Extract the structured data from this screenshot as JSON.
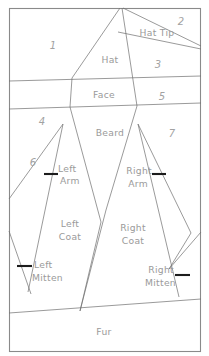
{
  "diagram": {
    "colors": {
      "line": "#6f6f6f",
      "frame": "#8a8a8a",
      "tick": "#1c1c1c",
      "text": "#9a9a9a",
      "background": "#ffffff"
    },
    "named_regions": [
      {
        "id": "hat",
        "label": "Hat",
        "x": 110,
        "y": 60
      },
      {
        "id": "hat-tip",
        "label": "Hat Tip",
        "x": 157,
        "y": 33
      },
      {
        "id": "face",
        "label": "Face",
        "x": 104,
        "y": 95
      },
      {
        "id": "beard",
        "label": "Beard",
        "x": 110,
        "y": 133
      },
      {
        "id": "left-arm",
        "label": "Left",
        "x": 65,
        "y": 169
      },
      {
        "id": "left-arm-2",
        "label": "Arm",
        "x": 65,
        "y": 181
      },
      {
        "id": "right-arm",
        "label": "Right",
        "x": 141,
        "y": 171
      },
      {
        "id": "right-arm-2",
        "label": "Arm",
        "x": 141,
        "y": 184
      },
      {
        "id": "left-coat",
        "label": "Left",
        "x": 70,
        "y": 224
      },
      {
        "id": "left-coat-2",
        "label": "Coat",
        "x": 70,
        "y": 237
      },
      {
        "id": "right-coat",
        "label": "Right",
        "x": 132,
        "y": 228
      },
      {
        "id": "right-coat-2",
        "label": "Coat",
        "x": 132,
        "y": 241
      },
      {
        "id": "left-mitten",
        "label": "Left",
        "x": 43,
        "y": 265
      },
      {
        "id": "left-mitten-2",
        "label": "Mitten",
        "x": 47,
        "y": 278
      },
      {
        "id": "right-mitten",
        "label": "Right",
        "x": 160,
        "y": 270
      },
      {
        "id": "right-mitten-2",
        "label": "Mitten",
        "x": 162,
        "y": 283
      },
      {
        "id": "fur",
        "label": "Fur",
        "x": 104,
        "y": 332
      }
    ],
    "numbered_regions": [
      {
        "id": "region-1",
        "label": "1",
        "x": 53,
        "y": 46
      },
      {
        "id": "region-2",
        "label": "2",
        "x": 181,
        "y": 22
      },
      {
        "id": "region-3",
        "label": "3",
        "x": 158,
        "y": 65
      },
      {
        "id": "region-4",
        "label": "4",
        "x": 42,
        "y": 122
      },
      {
        "id": "region-5",
        "label": "5",
        "x": 162,
        "y": 97
      },
      {
        "id": "region-6",
        "label": "6",
        "x": 33,
        "y": 163
      },
      {
        "id": "region-7",
        "label": "7",
        "x": 172,
        "y": 134
      }
    ],
    "tick_marks": [
      {
        "id": "tick-left-arm",
        "x1": 44,
        "y1": 174,
        "x2": 58,
        "y2": 174
      },
      {
        "id": "tick-right-arm",
        "x1": 152,
        "y1": 174,
        "x2": 166,
        "y2": 174
      },
      {
        "id": "tick-left-mitten",
        "x1": 17,
        "y1": 266,
        "x2": 32,
        "y2": 266
      },
      {
        "id": "tick-right-mitten",
        "x1": 175,
        "y1": 275,
        "x2": 190,
        "y2": 275
      }
    ],
    "frame": {
      "left": 9,
      "top": 8,
      "right": 201,
      "bottom": 352
    },
    "boundary_lines": [
      {
        "id": "hat-left-edge",
        "points": "120,8 72,78"
      },
      {
        "id": "hat-right-edge",
        "points": "122,8 137,106"
      },
      {
        "id": "hat-tip-upper",
        "points": "123,8 201,46"
      },
      {
        "id": "hat-tip-lower",
        "points": "118,33 201,49"
      },
      {
        "id": "face-top",
        "points": "9,80 201,76"
      },
      {
        "id": "face-bottom",
        "points": "9,108 201,103"
      },
      {
        "id": "face-left-edge",
        "points": "72,78 70,106"
      },
      {
        "id": "beard-left",
        "points": "70,106 101,222"
      },
      {
        "id": "beard-right",
        "points": "137,106 106,210"
      },
      {
        "id": "beard-bottom-left",
        "points": "101,222 80,310"
      },
      {
        "id": "beard-bottom-right",
        "points": "106,210 80,310"
      },
      {
        "id": "left-arm-outer",
        "points": "63,123 9,198"
      },
      {
        "id": "left-arm-inner",
        "points": "63,123 27,290"
      },
      {
        "id": "left-arm-lower",
        "points": "9,230 30,292"
      },
      {
        "id": "left-coat-left",
        "points": "63,123 27,290"
      },
      {
        "id": "right-arm-outer",
        "points": "138,123 190,232"
      },
      {
        "id": "right-arm-inner",
        "points": "138,123 178,296"
      },
      {
        "id": "right-mitten-edge",
        "points": "168,268 201,232"
      },
      {
        "id": "right-mitten-lower",
        "points": "168,268 190,232"
      },
      {
        "id": "fur-top",
        "points": "9,312 201,299"
      }
    ]
  }
}
